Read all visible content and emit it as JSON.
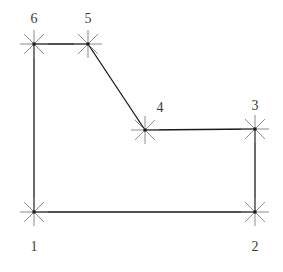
{
  "figure": {
    "width": 283,
    "height": 272,
    "background_color": "#ffffff",
    "edge_color": "#1a1a1a",
    "marker_color": "#8c8c8c",
    "label_color": "#3a3a3a",
    "marker": {
      "type": "eight-ray-star",
      "radius": 14,
      "ray_count": 8,
      "stroke_width": 1
    }
  },
  "vertices": [
    {
      "id": "1",
      "label": "1",
      "x": 34,
      "y": 212,
      "label_x": 34,
      "label_y": 251
    },
    {
      "id": "2",
      "label": "2",
      "x": 255,
      "y": 212,
      "label_x": 255,
      "label_y": 251
    },
    {
      "id": "3",
      "label": "3",
      "x": 255,
      "y": 129,
      "label_x": 255,
      "label_y": 110
    },
    {
      "id": "4",
      "label": "4",
      "x": 145,
      "y": 130,
      "label_x": 160,
      "label_y": 112
    },
    {
      "id": "5",
      "label": "5",
      "x": 88,
      "y": 44,
      "label_x": 88,
      "label_y": 23
    },
    {
      "id": "6",
      "label": "6",
      "x": 34,
      "y": 44,
      "label_x": 34,
      "label_y": 23
    }
  ],
  "edges": [
    {
      "id": "edge-1-2",
      "from": "1",
      "to": "2",
      "x1": 34,
      "y1": 212,
      "x2": 255,
      "y2": 212
    },
    {
      "id": "edge-2-3",
      "from": "2",
      "to": "3",
      "x1": 255,
      "y1": 212,
      "x2": 255,
      "y2": 129
    },
    {
      "id": "edge-3-4",
      "from": "3",
      "to": "4",
      "x1": 255,
      "y1": 129,
      "x2": 145,
      "y2": 130
    },
    {
      "id": "edge-4-5",
      "from": "4",
      "to": "5",
      "x1": 145,
      "y1": 130,
      "x2": 88,
      "y2": 44
    },
    {
      "id": "edge-5-6",
      "from": "5",
      "to": "6",
      "x1": 88,
      "y1": 44,
      "x2": 34,
      "y2": 44
    },
    {
      "id": "edge-6-1",
      "from": "6",
      "to": "1",
      "x1": 34,
      "y1": 44,
      "x2": 34,
      "y2": 212
    }
  ]
}
